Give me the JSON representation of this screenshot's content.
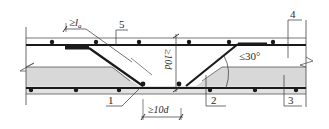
{
  "diagram": {
    "title": "",
    "type": "reinforcement-detail-section",
    "colors": {
      "line": "#2a2a2a",
      "rebar": "#1a1a1a",
      "concrete_fill": "#d8d8d8",
      "background": "#ffffff"
    },
    "labels": {
      "anchorage_length": "≥la",
      "anchorage_length_main": "≥l",
      "anchorage_length_sub": "a",
      "vertical_dim": "≥10d",
      "horizontal_dim": "≥10d",
      "angle": "≤30°",
      "callout_1": "1",
      "callout_2": "2",
      "callout_3": "3",
      "callout_4": "4",
      "callout_5": "5"
    },
    "top_rebar_dots_x": [
      52,
      96,
      139,
      189,
      229,
      273
    ],
    "bottom_rebar_dots_x": [
      31,
      76,
      119,
      179,
      210,
      255,
      296
    ]
  }
}
